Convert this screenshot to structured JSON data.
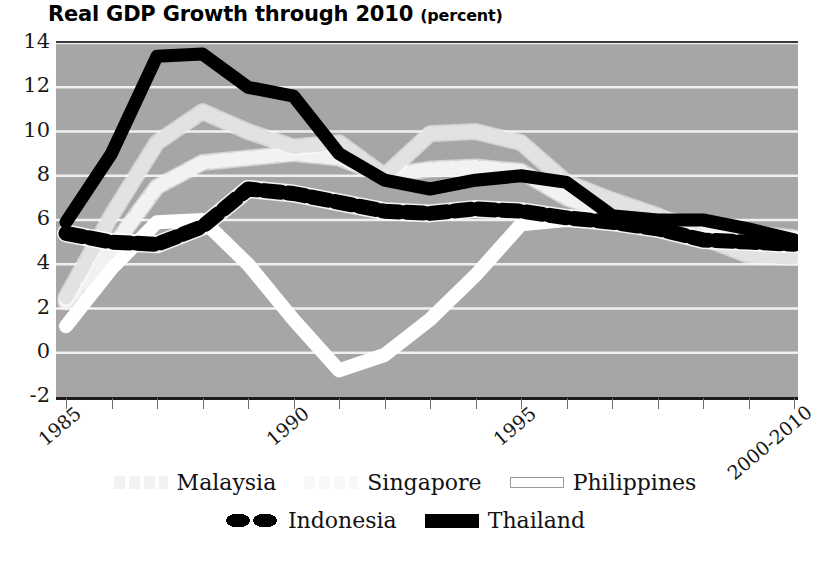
{
  "title": {
    "main": "Real GDP Growth through 2010",
    "unit": "(percent)"
  },
  "axes": {
    "y_ticks": [
      14,
      12,
      10,
      8,
      6,
      4,
      2,
      0,
      -2
    ],
    "x_tick_labels": [
      "1985",
      "1990",
      "1995",
      "2000-2010"
    ]
  },
  "legend": {
    "row1": [
      {
        "label": "Malaysia",
        "swatch": "sw-malaysia",
        "icon": "dashed-light-gray-line-swatch"
      },
      {
        "label": "Singapore",
        "swatch": "sw-singapore",
        "icon": "dashed-white-line-swatch"
      },
      {
        "label": "Philippines",
        "swatch": "sw-philippines",
        "icon": "white-outlined-line-swatch"
      }
    ],
    "row2": [
      {
        "label": "Indonesia",
        "swatch": "sw-indonesia",
        "icon": "black-dotted-line-swatch"
      },
      {
        "label": "Thailand",
        "swatch": "sw-thailand",
        "icon": "black-solid-line-swatch"
      }
    ]
  },
  "colors": {
    "plot_background": "#a6a6a6",
    "gridline": "#f0f0f0",
    "malaysia": "#e2e2e2",
    "singapore": "#f2f2f2",
    "philippines": "#ffffff",
    "indonesia": "#000000",
    "thailand": "#000000",
    "axis": "#1c1c1c",
    "text": "#111111"
  },
  "chart_data": {
    "type": "line",
    "title": "Real GDP Growth through 2010 (percent)",
    "subtitle": "",
    "xlabel": "",
    "ylabel": "percent",
    "ylim": [
      -2,
      14
    ],
    "xlim": [
      1985,
      2010
    ],
    "grid": true,
    "legend_position": "bottom",
    "x_tick_values": [
      1985,
      1990,
      1995,
      2010
    ],
    "x_tick_labels": [
      "1985",
      "1990",
      "1995",
      "2000-2010"
    ],
    "y_ticks": [
      -2,
      0,
      2,
      4,
      6,
      8,
      10,
      12,
      14
    ],
    "x": [
      1985,
      1986,
      1987,
      1988,
      1989,
      1990,
      1991,
      1992,
      1993,
      1994,
      1995,
      1996,
      1997,
      1998,
      1999,
      2000,
      2010
    ],
    "series": [
      {
        "name": "Malaysia",
        "color": "#e2e2e2",
        "style": "dotted",
        "values": [
          2.5,
          6.2,
          9.5,
          10.9,
          10.0,
          9.3,
          9.5,
          8.0,
          9.9,
          10.0,
          9.5,
          7.7,
          6.9,
          6.2,
          5.2,
          4.4,
          4.3
        ]
      },
      {
        "name": "Singapore",
        "color": "#f2f2f2",
        "style": "dotted",
        "values": [
          2.3,
          4.7,
          7.5,
          8.6,
          8.8,
          9.0,
          8.8,
          8.0,
          8.3,
          8.4,
          8.2,
          7.0,
          6.3,
          6.1,
          5.7,
          5.4,
          5.2
        ]
      },
      {
        "name": "Philippines",
        "color": "#ffffff",
        "style": "solid",
        "values": [
          1.2,
          3.8,
          5.9,
          6.0,
          4.0,
          1.5,
          -0.8,
          -0.1,
          1.5,
          3.5,
          5.8,
          6.0,
          5.9,
          5.9,
          5.7,
          5.3,
          5.2
        ]
      },
      {
        "name": "Indonesia",
        "color": "#000000",
        "style": "dotted",
        "values": [
          5.4,
          5.0,
          4.9,
          5.7,
          7.4,
          7.2,
          6.8,
          6.4,
          6.3,
          6.5,
          6.4,
          6.1,
          5.9,
          5.6,
          5.1,
          5.0,
          4.9
        ]
      },
      {
        "name": "Thailand",
        "color": "#000000",
        "style": "solid",
        "values": [
          5.9,
          9.0,
          13.4,
          13.5,
          12.0,
          11.6,
          9.0,
          7.8,
          7.4,
          7.8,
          8.0,
          7.7,
          6.2,
          6.0,
          6.0,
          5.6,
          5.1
        ]
      }
    ]
  }
}
